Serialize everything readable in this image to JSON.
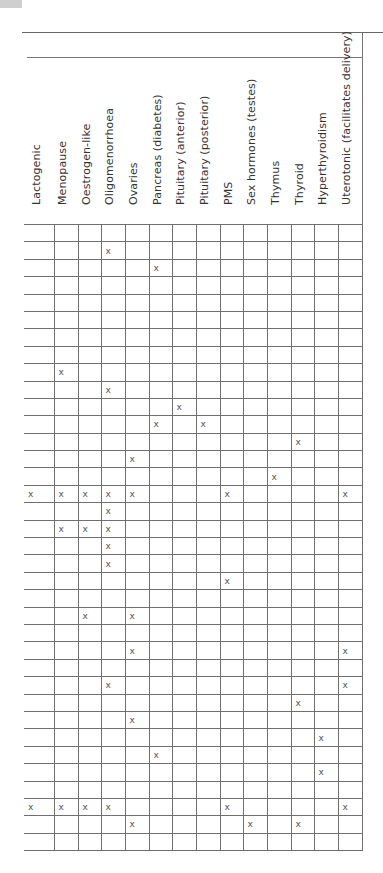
{
  "table": {
    "columns": [
      "Lactogenic",
      "Menopause",
      "Oestrogen-like",
      "Oligomenorrhoea",
      "Ovaries",
      "Pancreas (diabetes)",
      "Pituitary (anterior)",
      "Pituitary (posterior)",
      "PMS",
      "Sex hormones (testes)",
      "Thymus",
      "Thyroid",
      "Hyperthyroidism",
      "Uterotonic (facilitates delivery)"
    ],
    "mark": "x",
    "rows": [
      [],
      [
        "Oligomenorrhoea"
      ],
      [
        "Pancreas (diabetes)"
      ],
      [],
      [],
      [],
      [],
      [],
      [
        "Menopause"
      ],
      [
        "Oligomenorrhoea"
      ],
      [
        "Pituitary (anterior)"
      ],
      [
        "Pancreas (diabetes)",
        "Pituitary (posterior)"
      ],
      [
        "Thyroid"
      ],
      [
        "Ovaries"
      ],
      [
        "Thymus"
      ],
      [
        "Lactogenic",
        "Menopause",
        "Oestrogen-like",
        "Oligomenorrhoea",
        "Ovaries",
        "PMS",
        "Uterotonic (facilitates delivery)"
      ],
      [
        "Oligomenorrhoea"
      ],
      [
        "Menopause",
        "Oestrogen-like",
        "Oligomenorrhoea"
      ],
      [
        "Oligomenorrhoea"
      ],
      [
        "Oligomenorrhoea"
      ],
      [
        "PMS"
      ],
      [],
      [
        "Oestrogen-like",
        "Ovaries"
      ],
      [],
      [
        "Ovaries",
        "Uterotonic (facilitates delivery)"
      ],
      [],
      [
        "Oligomenorrhoea",
        "Uterotonic (facilitates delivery)"
      ],
      [
        "Thyroid"
      ],
      [
        "Ovaries"
      ],
      [
        "Hyperthyroidism"
      ],
      [
        "Pancreas (diabetes)"
      ],
      [
        "Hyperthyroidism"
      ],
      [],
      [
        "Lactogenic",
        "Menopause",
        "Oestrogen-like",
        "Oligomenorrhoea",
        "PMS",
        "Uterotonic (facilitates delivery)"
      ],
      [
        "Ovaries",
        "Sex hormones (testes)",
        "Thyroid"
      ],
      []
    ]
  },
  "colors": {
    "grid_line": "#6f6f6f",
    "text": "#333333",
    "corner_block": "#cfcfcf"
  }
}
